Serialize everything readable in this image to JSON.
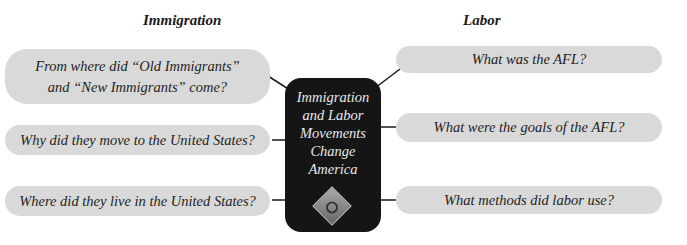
{
  "headings": {
    "left": "Immigration",
    "right": "Labor"
  },
  "center": {
    "title": "Immigration and Labor Movements Change America",
    "lines": [
      "Immigration",
      "and Labor",
      "Movements",
      "Change",
      "America"
    ],
    "emblem_icon": "diamond-emblem-icon"
  },
  "immigration_questions": [
    {
      "line1": "From where did “Old Immigrants”",
      "line2": "and “New Immigrants” come?"
    },
    {
      "line1": "Why did they move to the United States?"
    },
    {
      "line1": "Where did they live in the United States?"
    }
  ],
  "labor_questions": [
    {
      "line1": "What was the AFL?"
    },
    {
      "line1": "What were the goals of the AFL?"
    },
    {
      "line1": "What methods did labor use?"
    }
  ],
  "colors": {
    "box": "#d9d9d9",
    "center": "#151515",
    "line": "#1a1a1a"
  }
}
